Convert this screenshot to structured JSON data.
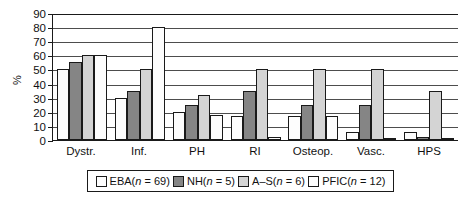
{
  "chart_data": {
    "type": "bar",
    "title": "",
    "subtitle": "",
    "xlabel": "",
    "ylabel": "%",
    "ylim": [
      0,
      90
    ],
    "ytick_step": 10,
    "yticks": [
      "90",
      "80",
      "70",
      "60",
      "50",
      "40",
      "30",
      "20",
      "10",
      "0"
    ],
    "grid": true,
    "legend_position": "bottom",
    "categories": [
      "Dystr.",
      "Inf.",
      "PH",
      "RI",
      "Osteop.",
      "Vasc.",
      "HPS"
    ],
    "series": [
      {
        "name": "EBA(n = 69)",
        "label_main": "EBA(",
        "label_n": "n",
        "label_rest": " = 69)",
        "color": "#fdfdfd",
        "values": [
          50,
          30,
          20,
          17,
          17,
          6,
          6
        ]
      },
      {
        "name": "NH(n = 5)",
        "label_main": "NH(",
        "label_n": "n",
        "label_rest": " = 5)",
        "color": "#858585",
        "values": [
          55,
          35,
          25,
          35,
          25,
          25,
          2
        ]
      },
      {
        "name": "A–S(n = 6)",
        "label_main": "A–S(",
        "label_n": "n",
        "label_rest": " = 6)",
        "color": "#d4d4d4",
        "values": [
          60,
          50,
          32,
          50,
          50,
          50,
          35
        ]
      },
      {
        "name": "PFIC(n = 12)",
        "label_main": "PFIC(",
        "label_n": "n",
        "label_rest": " = 12)",
        "color": "#fdfdfd",
        "values": [
          60,
          80,
          18,
          2,
          17,
          1.5,
          1.5
        ]
      }
    ]
  }
}
